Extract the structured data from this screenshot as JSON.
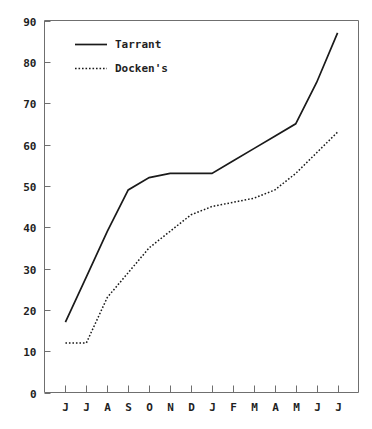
{
  "chart_data": {
    "type": "line",
    "title": "",
    "subtitle": "",
    "xlabel": "",
    "ylabel": "",
    "x": [
      "J",
      "J",
      "A",
      "S",
      "O",
      "N",
      "D",
      "J",
      "F",
      "M",
      "A",
      "M",
      "J",
      "J"
    ],
    "categories": [
      "J",
      "J",
      "A",
      "S",
      "O",
      "N",
      "D",
      "J",
      "F",
      "M",
      "A",
      "M",
      "J",
      "J"
    ],
    "xtick_labels": [
      "J",
      "J",
      "A",
      "S",
      "O",
      "N",
      "D",
      "J",
      "F",
      "M",
      "A",
      "M",
      "J",
      "J"
    ],
    "ytick_labels": [
      "0",
      "10",
      "20",
      "30",
      "40",
      "50",
      "60",
      "70",
      "80",
      "90"
    ],
    "ytick_values": [
      0,
      10,
      20,
      30,
      40,
      50,
      60,
      70,
      80,
      90
    ],
    "ylim": [
      0,
      90
    ],
    "grid": false,
    "legend_position": "top-left inside plot",
    "series": [
      {
        "name": "Tarrant",
        "style": "solid",
        "color": "#1a1a1a",
        "values": [
          17,
          28,
          39,
          49,
          52,
          53,
          53,
          53,
          56,
          59,
          62,
          65,
          75,
          87
        ]
      },
      {
        "name": "Docken's",
        "style": "dotted",
        "color": "#1a1a1a",
        "values": [
          12,
          12,
          23,
          29,
          35,
          39,
          43,
          45,
          46,
          47,
          49,
          53,
          58,
          63
        ]
      }
    ],
    "legend": [
      {
        "label": "Tarrant",
        "style": "solid"
      },
      {
        "label": "Docken's",
        "style": "dotted"
      }
    ],
    "annotations": []
  },
  "colors": {
    "background": "#ffffff",
    "ink": "#1a1a1a",
    "frame": "#6f6f6f"
  }
}
